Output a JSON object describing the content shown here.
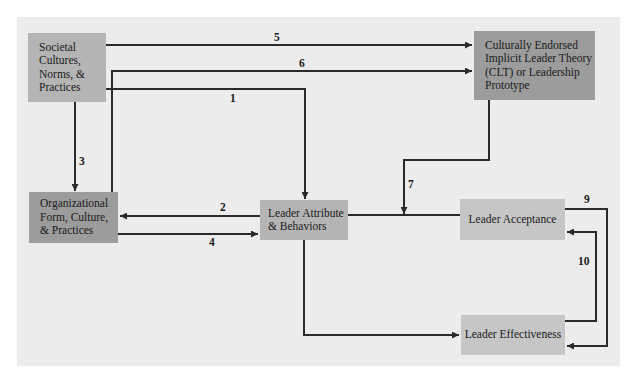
{
  "diagram": {
    "nodes": {
      "societal": {
        "label": "Societal Cultures, Norms, & Practices",
        "lines": [
          "Societal",
          "Cultures,",
          "Norms, &",
          "Practices"
        ]
      },
      "clt": {
        "label": "Culturally Endorsed Implicit Leader Theory (CLT) or Leadership Prototype",
        "lines": [
          "Culturally Endorsed",
          "Implicit Leader Theory",
          "(CLT) or Leadership",
          "Prototype"
        ]
      },
      "organizational": {
        "label": "Organizational Form, Culture, & Practices",
        "lines": [
          "Organizational",
          "Form, Culture,",
          "& Practices"
        ]
      },
      "leader_attribute": {
        "label": "Leader Attribute & Behaviors",
        "lines": [
          "Leader Attribute",
          "& Behaviors"
        ]
      },
      "leader_acceptance": {
        "label": "Leader Acceptance"
      },
      "leader_effectiveness": {
        "label": "Leader Effectiveness"
      }
    },
    "edges": [
      {
        "id": "1",
        "label": "1",
        "from": "Societal Cultures, Norms, & Practices",
        "to": "Leader Attribute & Behaviors"
      },
      {
        "id": "2",
        "label": "2",
        "from": "Leader Attribute & Behaviors",
        "to": "Organizational Form, Culture, & Practices"
      },
      {
        "id": "3",
        "label": "3",
        "from": "Societal Cultures, Norms, & Practices",
        "to": "Organizational Form, Culture, & Practices"
      },
      {
        "id": "4",
        "label": "4",
        "from": "Organizational Form, Culture, & Practices",
        "to": "Leader Attribute & Behaviors"
      },
      {
        "id": "5",
        "label": "5",
        "from": "Societal Cultures, Norms, & Practices",
        "to": "Culturally Endorsed Implicit Leader Theory (CLT) or Leadership Prototype"
      },
      {
        "id": "6",
        "label": "6",
        "from": "Organizational Form, Culture, & Practices",
        "to": "Culturally Endorsed Implicit Leader Theory (CLT) or Leadership Prototype"
      },
      {
        "id": "7",
        "label": "7",
        "from": "Culturally Endorsed Implicit Leader Theory (CLT) or Leadership Prototype",
        "to": "Leader Attribute & Behaviors — Leader Acceptance link"
      },
      {
        "id": "8",
        "label": "",
        "from": "Leader Attribute & Behaviors",
        "to": "Leader Effectiveness"
      },
      {
        "id": "9",
        "label": "9",
        "from": "Leader Acceptance",
        "to": "Leader Effectiveness"
      },
      {
        "id": "10",
        "label": "10",
        "from": "Leader Effectiveness",
        "to": "Leader Acceptance"
      }
    ],
    "colors": {
      "panel": "#ececec",
      "dark_box": "#9c9c9c",
      "mid_box": "#b4b4b4",
      "light_box": "#c6c6c6",
      "line": "#2a2a2a"
    }
  }
}
